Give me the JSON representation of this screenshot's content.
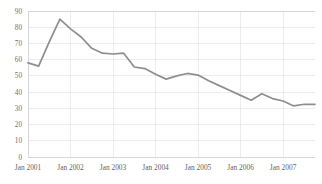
{
  "chart_data": {
    "type": "line",
    "title": "",
    "subtitle": "",
    "xlabel": "",
    "ylabel": "",
    "ylim": [
      0,
      90
    ],
    "ytick_step": 10,
    "yticks": [
      90,
      80,
      70,
      60,
      50,
      40,
      30,
      20,
      10,
      0
    ],
    "grid": true,
    "legend": false,
    "legend_position": "none",
    "line_color": "#8e8e8e",
    "grid_color": "#e4e4e8",
    "axis_color": "#cfcfd4",
    "text_color": "#5f5f5f",
    "categories": [
      "Jan 2001",
      "Apr 2001",
      "Jul 2001",
      "Oct 2001",
      "Jan 2002",
      "Apr 2002",
      "Jul 2002",
      "Oct 2002",
      "Jan 2003",
      "Apr 2003",
      "Jul 2003",
      "Oct 2003",
      "Jan 2004",
      "Apr 2004",
      "Jul 2004",
      "Oct 2004",
      "Jan 2005",
      "Apr 2005",
      "Jul 2005",
      "Oct 2005",
      "Jan 2006",
      "Apr 2006",
      "Jul 2006",
      "Oct 2006",
      "Jan 2007",
      "Apr 2007",
      "Jul 2007",
      "Oct 2007"
    ],
    "xtick_labels": [
      "Jan 2001",
      "Jan 2002",
      "Jan 2003",
      "Jan 2004",
      "Jan 2005",
      "Jan 2006",
      "Jan 2007"
    ],
    "xtick_indices": [
      0,
      4,
      8,
      12,
      16,
      20,
      24
    ],
    "values": [
      58,
      56,
      71,
      85,
      79,
      74,
      67,
      64,
      63.5,
      64,
      55.5,
      54.5,
      51,
      48,
      50,
      51.5,
      50.5,
      47,
      44,
      41,
      38,
      35,
      39,
      36,
      34.5,
      31.5,
      32.5,
      32.5
    ],
    "x_range": [
      0,
      27
    ],
    "series_name": ""
  },
  "plot": {
    "left": 28,
    "right": 315,
    "top": 11,
    "bottom": 157
  }
}
